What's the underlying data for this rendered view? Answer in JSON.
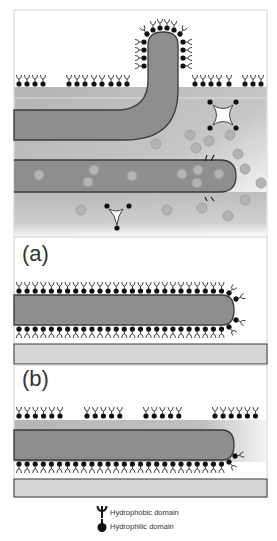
{
  "figure": {
    "panels": [
      {
        "id": "top",
        "label": "",
        "description": "Lipid bilayer on substrate with bending tube and diffusing particles"
      },
      {
        "id": "a",
        "label": "(a)"
      },
      {
        "id": "b",
        "label": "(b)"
      }
    ],
    "colors": {
      "frame": "#cfcfcf",
      "tube_fill": "#8c8c8c",
      "tube_stroke": "#3a3a3a",
      "matrix_fill": "#b8b8b8",
      "substrate_fill": "#d6d6d6",
      "substrate_stroke": "#3a3a3a",
      "lipid_head": "#111111",
      "lipid_tail": "#333333",
      "particle_fill": "#b0b0b0",
      "particle_stroke": "#8a8a8a"
    },
    "legend": {
      "items": [
        {
          "icon": "hydrophobic-domain-icon",
          "label": "Hydrophobic domain"
        },
        {
          "icon": "hydrophilic-domain-icon",
          "label": "Hydrophilic domain"
        }
      ]
    }
  }
}
